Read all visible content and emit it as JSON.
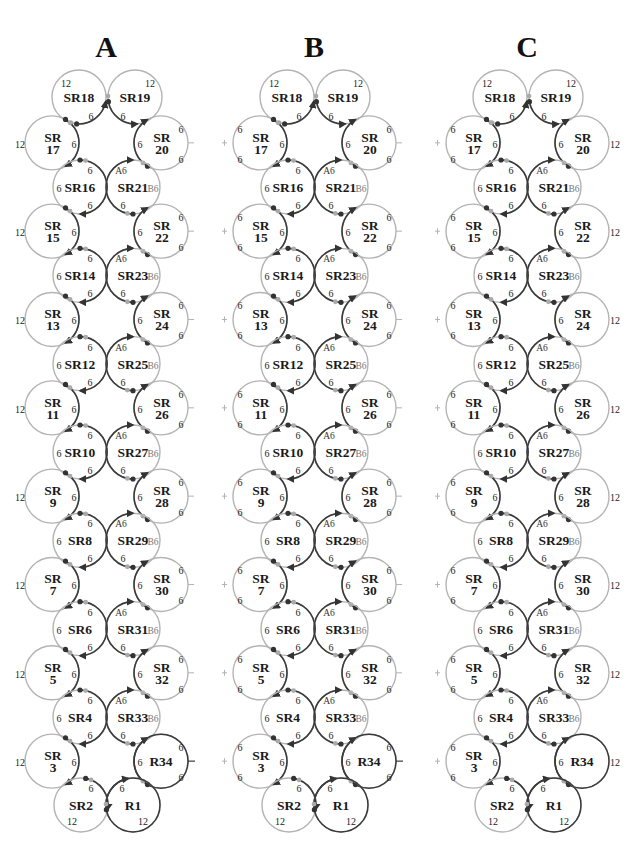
{
  "figure": {
    "panels": [
      {
        "id": "A",
        "title": "A",
        "offset_x": 0,
        "outer_label_mode": "twelve"
      },
      {
        "id": "B",
        "title": "B",
        "offset_x": 208,
        "outer_label_mode": "six_six"
      },
      {
        "id": "C",
        "title": "C",
        "offset_x": 421,
        "outer_label_mode": "six_six_left_twelve_right"
      }
    ],
    "colors": {
      "dark_ring": "#3a3a3a",
      "light_ring": "#b4b4b4",
      "junction_dark": "#333333",
      "junction_light": "#aaaaaa",
      "text": "#1a1a1a"
    },
    "rings": [
      {
        "name": "SR18",
        "label": "SR18",
        "kind": "top-left"
      },
      {
        "name": "SR19",
        "label": "SR19",
        "kind": "top-right"
      },
      {
        "name": "SR17",
        "label_top": "SR",
        "label_bottom": "17",
        "kind": "outer-left"
      },
      {
        "name": "SR20",
        "label_top": "SR",
        "label_bottom": "20",
        "kind": "outer-right"
      },
      {
        "name": "SR16",
        "label": "SR16",
        "kind": "inner-left"
      },
      {
        "name": "SR21",
        "label": "SR21",
        "kind": "inner-right"
      },
      {
        "name": "SR15",
        "label_top": "SR",
        "label_bottom": "15",
        "kind": "outer-left"
      },
      {
        "name": "SR22",
        "label_top": "SR",
        "label_bottom": "22",
        "kind": "outer-right"
      },
      {
        "name": "SR14",
        "label": "SR14",
        "kind": "inner-left"
      },
      {
        "name": "SR23",
        "label": "SR23",
        "kind": "inner-right"
      },
      {
        "name": "SR13",
        "label_top": "SR",
        "label_bottom": "13",
        "kind": "outer-left"
      },
      {
        "name": "SR24",
        "label_top": "SR",
        "label_bottom": "24",
        "kind": "outer-right"
      },
      {
        "name": "SR12",
        "label": "SR12",
        "kind": "inner-left"
      },
      {
        "name": "SR25",
        "label": "SR25",
        "kind": "inner-right"
      },
      {
        "name": "SR11",
        "label_top": "SR",
        "label_bottom": "11",
        "kind": "outer-left"
      },
      {
        "name": "SR26",
        "label_top": "SR",
        "label_bottom": "26",
        "kind": "outer-right"
      },
      {
        "name": "SR10",
        "label": "SR10",
        "kind": "inner-left"
      },
      {
        "name": "SR27",
        "label": "SR27",
        "kind": "inner-right"
      },
      {
        "name": "SR9",
        "label_top": "SR",
        "label_bottom": "9",
        "kind": "outer-left"
      },
      {
        "name": "SR28",
        "label_top": "SR",
        "label_bottom": "28",
        "kind": "outer-right"
      },
      {
        "name": "SR8",
        "label": "SR8",
        "kind": "inner-left"
      },
      {
        "name": "SR29",
        "label": "SR29",
        "kind": "inner-right"
      },
      {
        "name": "SR7",
        "label_top": "SR",
        "label_bottom": "7",
        "kind": "outer-left"
      },
      {
        "name": "SR30",
        "label_top": "SR",
        "label_bottom": "30",
        "kind": "outer-right"
      },
      {
        "name": "SR6",
        "label": "SR6",
        "kind": "inner-left"
      },
      {
        "name": "SR31",
        "label": "SR31",
        "kind": "inner-right"
      },
      {
        "name": "SR5",
        "label_top": "SR",
        "label_bottom": "5",
        "kind": "outer-left"
      },
      {
        "name": "SR32",
        "label_top": "SR",
        "label_bottom": "32",
        "kind": "outer-right"
      },
      {
        "name": "SR4",
        "label": "SR4",
        "kind": "inner-left"
      },
      {
        "name": "SR33",
        "label": "SR33",
        "kind": "inner-right"
      },
      {
        "name": "SR3",
        "label_top": "SR",
        "label_bottom": "3",
        "kind": "outer-left"
      },
      {
        "name": "R34",
        "label": "R34",
        "kind": "outer-right-final"
      },
      {
        "name": "SR2",
        "label": "SR2",
        "kind": "bottom-left"
      },
      {
        "name": "R1",
        "label": "R1",
        "kind": "bottom-right"
      }
    ],
    "numbers": {
      "six": "6",
      "twelve": "12",
      "a_six": "A6",
      "b_six": "B6"
    }
  }
}
